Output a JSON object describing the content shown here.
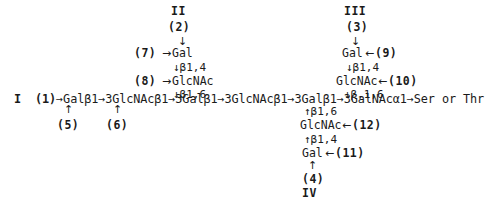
{
  "figure": {
    "type": "glycan-structure-diagram",
    "main_chain": {
      "label": "I",
      "step": "(1)",
      "sequence": "Galβ1→3GlcNAcβ1→3Galβ1→3GlcNAcβ1→3Galβ1→3GalNAcα1→Ser or Thr",
      "full_text": "I  (1)→Galβ1→3GlcNAcβ1→3Galβ1→3GlcNAcβ1→3Galβ1→3GalNAcα1→Ser or Thr",
      "terminus": "Ser or Thr"
    },
    "branch_II": {
      "label": "II",
      "step": "(2)",
      "down_arrow": "↓",
      "rows": [
        {
          "step": "(7)",
          "connector": "→",
          "residue": "Gal"
        },
        {
          "linkage": "↓β1,4"
        },
        {
          "step": "(8)",
          "connector": "→",
          "residue": "GlcNAc"
        },
        {
          "linkage": "↓β1,6"
        }
      ]
    },
    "branch_III": {
      "label": "III",
      "step": "(3)",
      "down_arrow": "↓",
      "rows": [
        {
          "residue": "Gal",
          "connector": "←",
          "step": "(9)"
        },
        {
          "linkage": "↓β1,4"
        },
        {
          "residue": "GlcNAc",
          "connector": "←",
          "step": "(10)"
        },
        {
          "linkage": "↓β,1,6"
        }
      ]
    },
    "branch_IV": {
      "label": "IV",
      "step": "(4)",
      "up_arrow": "↑",
      "rows": [
        {
          "linkage": "↑β1,6"
        },
        {
          "residue": "GlcNAc",
          "connector": "←",
          "step": "(12)"
        },
        {
          "linkage": "↑β1,4"
        },
        {
          "residue": "Gal",
          "connector": "←",
          "step": "(11)"
        }
      ]
    },
    "lower_left_steps": [
      {
        "arrow": "↑",
        "step": "(5)"
      },
      {
        "arrow": "↑",
        "step": "(6)"
      }
    ]
  }
}
